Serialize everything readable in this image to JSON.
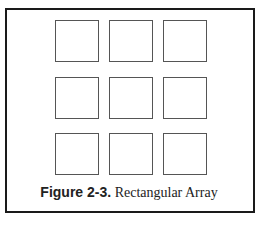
{
  "figure": {
    "label": "Figure 2-3.",
    "title": " Rectangular Array"
  },
  "array": {
    "rows": 3,
    "columns": 3,
    "cells": [
      {
        "row": 0,
        "col": 0
      },
      {
        "row": 0,
        "col": 1
      },
      {
        "row": 0,
        "col": 2
      },
      {
        "row": 1,
        "col": 0
      },
      {
        "row": 1,
        "col": 1
      },
      {
        "row": 1,
        "col": 2
      },
      {
        "row": 2,
        "col": 0
      },
      {
        "row": 2,
        "col": 1
      },
      {
        "row": 2,
        "col": 2
      }
    ]
  },
  "colors": {
    "frame": "#1a1a1a",
    "square_border": "#555555",
    "background": "#ffffff"
  }
}
